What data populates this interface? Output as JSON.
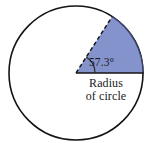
{
  "figure": {
    "name": "circle-sector-radian-diagram",
    "background_color": "#ffffff",
    "circle": {
      "center_x": 76,
      "center_y": 73,
      "radius": 67,
      "stroke_color": "#141414",
      "stroke_width": 1.6,
      "fill_color": "#ffffff"
    },
    "sector": {
      "start_angle_deg": 0,
      "end_angle_deg": 57.3,
      "fill_color": "#8593cc",
      "edge_color": "#3b4372",
      "edge_width": 1.3
    },
    "dashed_radius": {
      "angle_deg": 57.3,
      "stroke_color": "#1a1a1a",
      "stroke_width": 1.5,
      "dash_pattern": "4 2.6"
    },
    "solid_radius": {
      "angle_deg": 0,
      "stroke_color": "#141414",
      "stroke_width": 1.7
    },
    "angle_arc": {
      "radius": 19,
      "stroke_color": "#2a2a2a",
      "stroke_width": 1.2
    }
  },
  "labels": {
    "angle": "57.3°",
    "radius_line1": "Radius",
    "radius_line2": "of circle"
  },
  "chart_data": {
    "type": "pie",
    "title": "",
    "subtitle": "",
    "xlabel": "",
    "ylabel": "",
    "categories": [
      "Highlighted sector",
      "Remainder of circle"
    ],
    "values": [
      57.3,
      302.7
    ],
    "units": "degrees",
    "annotations": [
      "57.3°",
      "Radius",
      "of circle"
    ],
    "legend": [],
    "grid": false
  }
}
